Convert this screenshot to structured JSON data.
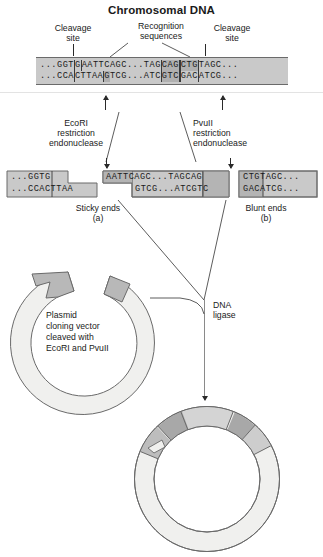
{
  "title": "Chromosomal DNA",
  "top_labels": {
    "cleavage_site_left": "Cleavage\nsite",
    "cleavage_site_left_line1": "Cleavage",
    "cleavage_site_left_line2": "site",
    "recognition_line1": "Recognition",
    "recognition_line2": "sequences",
    "cleavage_site_right_line1": "Cleavage",
    "cleavage_site_right_line2": "site"
  },
  "chromosomal_dna": {
    "top_strand": {
      "flank_left": "...GGT",
      "ecori_pre": "G",
      "ecori_core": "AATTC",
      "spacer": "AGC...TAG",
      "pvuii_first": "CAG",
      "pvuii_second": "CTG",
      "flank_right": "TAGC..."
    },
    "bottom_strand": {
      "flank_left": "...CCA",
      "ecori_core": "CTTAA",
      "ecori_post": "G",
      "spacer": "TCG...ATC",
      "pvuii_first": "GTC",
      "pvuii_second": "GAC",
      "flank_right": "ATCG..."
    }
  },
  "enzymes": {
    "left": {
      "name": "EcoRI",
      "line2": "restriction",
      "line3": "endonuclease"
    },
    "right": {
      "name": "PvuII",
      "line2": "restriction",
      "line3": "endonuclease"
    }
  },
  "fragments": {
    "left": {
      "top": "...GGTG",
      "bottom": "...CCACTTAA"
    },
    "middle": {
      "top": "AATTCAGC...TAGCAG",
      "bottom": "GTCG...ATCGTC",
      "top_parts": {
        "overhang": "AATTC",
        "spacer": "AGC...TAG",
        "pvuii": "CAG"
      },
      "bottom_parts": {
        "spacer": "GTCG...ATC",
        "pvuii": "GTC"
      }
    },
    "right": {
      "top": "CTGTAGC...",
      "bottom": "GACATCG...",
      "top_parts": {
        "pvuii": "CTG",
        "flank": "TAGC..."
      },
      "bottom_parts": {
        "pvuii": "GAC",
        "flank": "ATCG..."
      }
    }
  },
  "end_labels": {
    "sticky": "Sticky ends",
    "sticky_tag": "(a)",
    "blunt": "Blunt ends",
    "blunt_tag": "(b)"
  },
  "plasmid": {
    "caption_line1": "Plasmid",
    "caption_line2": "cloning vector",
    "caption_line3": "cleaved with",
    "caption_line4": "EcoRI and PvuII"
  },
  "ligase": {
    "line1": "DNA",
    "line2": "ligase"
  },
  "colors": {
    "dna_background": "#c9c9c9",
    "dna_shade": "#b0b0b0",
    "outline": "#6a6a6a",
    "text": "#1a1a1a",
    "plasmid_fill": "#f0f0ee",
    "plasmid_end_fill": "#b8b8b8",
    "insert_light": "#d4d4d4",
    "insert_mid": "#bdbdbd",
    "insert_dark": "#a2a2a2"
  }
}
